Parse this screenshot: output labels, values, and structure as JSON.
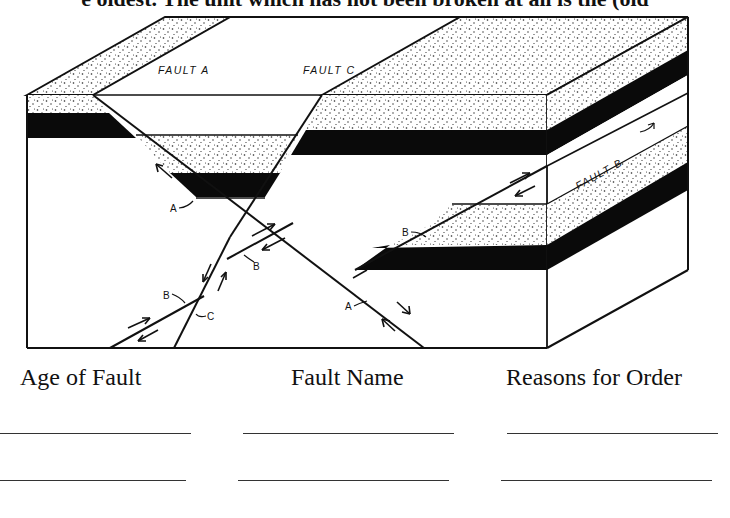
{
  "header": {
    "partial_text": "e oldest. The unit which has not been broken at all is the (old"
  },
  "diagram": {
    "fault_labels": {
      "fault_a": "FAULT A",
      "fault_c": "FAULT C",
      "fault_b": "FAULT B"
    },
    "pointer_labels": {
      "a_upper": "A",
      "a_lower": "A",
      "b_center": "B",
      "b_left": "B",
      "b_right": "B",
      "c_left": "C"
    },
    "colors": {
      "line": "#111111",
      "black_layer": "#0a0a0a",
      "stipple_dot": "#222222",
      "background": "#ffffff"
    }
  },
  "table": {
    "columns": [
      {
        "header": "Age of Fault"
      },
      {
        "header": "Fault Name"
      },
      {
        "header": "Reasons for Order"
      }
    ],
    "rows": [
      {
        "age": "",
        "name": "",
        "reason": ""
      },
      {
        "age": "",
        "name": "",
        "reason": ""
      }
    ]
  }
}
